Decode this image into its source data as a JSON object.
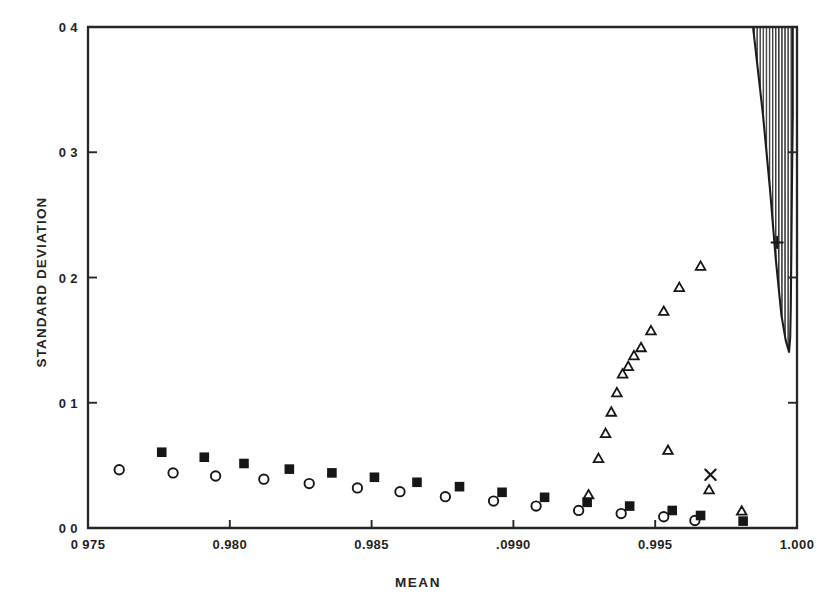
{
  "chart_data": {
    "type": "scatter",
    "title": "",
    "xlabel": "MEAN",
    "ylabel": "STANDARD DEVIATION",
    "xlim": [
      0.975,
      1.0
    ],
    "ylim": [
      0.0,
      0.4
    ],
    "grid": false,
    "legend": "none",
    "xticks": [
      0.975,
      0.98,
      0.985,
      0.99,
      0.995,
      1.0
    ],
    "xtick_labels": [
      "0 975",
      "0.980",
      "0.985",
      ".0990",
      "0.995",
      "1.000"
    ],
    "yticks": [
      0.0,
      0.1,
      0.2,
      0.3,
      0.4
    ],
    "ytick_labels": [
      "0 0",
      "0 1",
      "0 2",
      "0 3",
      "0 4"
    ],
    "series": [
      {
        "name": "filled-square-series",
        "marker": "filled-square",
        "points": [
          {
            "x": 0.9776,
            "y": 0.0605
          },
          {
            "x": 0.9791,
            "y": 0.0565
          },
          {
            "x": 0.9805,
            "y": 0.0515
          },
          {
            "x": 0.9821,
            "y": 0.047
          },
          {
            "x": 0.9836,
            "y": 0.044
          },
          {
            "x": 0.9851,
            "y": 0.0405
          },
          {
            "x": 0.9866,
            "y": 0.0365
          },
          {
            "x": 0.9881,
            "y": 0.033
          },
          {
            "x": 0.9896,
            "y": 0.0285
          },
          {
            "x": 0.9911,
            "y": 0.0245
          },
          {
            "x": 0.9926,
            "y": 0.0205
          },
          {
            "x": 0.9941,
            "y": 0.0175
          },
          {
            "x": 0.9956,
            "y": 0.014
          },
          {
            "x": 0.9966,
            "y": 0.01
          },
          {
            "x": 0.9981,
            "y": 0.0055
          }
        ]
      },
      {
        "name": "open-circle-series",
        "marker": "open-circle",
        "points": [
          {
            "x": 0.9761,
            "y": 0.0465
          },
          {
            "x": 0.978,
            "y": 0.044
          },
          {
            "x": 0.9795,
            "y": 0.0415
          },
          {
            "x": 0.9812,
            "y": 0.039
          },
          {
            "x": 0.9828,
            "y": 0.0355
          },
          {
            "x": 0.9845,
            "y": 0.032
          },
          {
            "x": 0.986,
            "y": 0.029
          },
          {
            "x": 0.9876,
            "y": 0.025
          },
          {
            "x": 0.9893,
            "y": 0.0215
          },
          {
            "x": 0.9908,
            "y": 0.0175
          },
          {
            "x": 0.9923,
            "y": 0.014
          },
          {
            "x": 0.9938,
            "y": 0.0115
          },
          {
            "x": 0.9953,
            "y": 0.009
          },
          {
            "x": 0.9964,
            "y": 0.006
          }
        ]
      },
      {
        "name": "open-triangle-series",
        "marker": "open-triangle",
        "points": [
          {
            "x": 0.99265,
            "y": 0.027
          },
          {
            "x": 0.993,
            "y": 0.056
          },
          {
            "x": 0.99325,
            "y": 0.076
          },
          {
            "x": 0.99345,
            "y": 0.093
          },
          {
            "x": 0.99365,
            "y": 0.1085
          },
          {
            "x": 0.99385,
            "y": 0.1235
          },
          {
            "x": 0.99405,
            "y": 0.1295
          },
          {
            "x": 0.99425,
            "y": 0.138
          },
          {
            "x": 0.9945,
            "y": 0.1445
          },
          {
            "x": 0.99485,
            "y": 0.158
          },
          {
            "x": 0.9953,
            "y": 0.1735
          },
          {
            "x": 0.99585,
            "y": 0.1925
          },
          {
            "x": 0.9966,
            "y": 0.2095
          },
          {
            "x": 0.99545,
            "y": 0.0625
          },
          {
            "x": 0.9969,
            "y": 0.031
          },
          {
            "x": 0.99805,
            "y": 0.014
          }
        ]
      },
      {
        "name": "cross-marker-series",
        "marker": "x-cross",
        "points": [
          {
            "x": 0.99695,
            "y": 0.0425
          }
        ]
      },
      {
        "name": "plus-marker-series",
        "marker": "plus",
        "points": [
          {
            "x": 0.9993,
            "y": 0.228
          }
        ]
      }
    ],
    "shaded_region": {
      "name": "hatched-funnel-region",
      "hatch": "vertical-lines",
      "description": "Narrow tapering hatched band at right edge extending from top of plot down to a rounded tip",
      "left_boundary": [
        {
          "x": 0.99845,
          "y": 0.4
        },
        {
          "x": 0.9988,
          "y": 0.33
        },
        {
          "x": 0.99905,
          "y": 0.27
        },
        {
          "x": 0.99925,
          "y": 0.215
        },
        {
          "x": 0.99945,
          "y": 0.17
        },
        {
          "x": 0.9996,
          "y": 0.15
        },
        {
          "x": 0.99972,
          "y": 0.1405
        }
      ],
      "right_boundary": [
        {
          "x": 0.99985,
          "y": 0.4
        },
        {
          "x": 0.99985,
          "y": 0.33
        },
        {
          "x": 0.99982,
          "y": 0.27
        },
        {
          "x": 0.9998,
          "y": 0.22
        },
        {
          "x": 0.99978,
          "y": 0.175
        },
        {
          "x": 0.99976,
          "y": 0.152
        },
        {
          "x": 0.99972,
          "y": 0.1405
        }
      ]
    }
  },
  "colors": {
    "axis": "#262626",
    "marker": "#161616",
    "text": "#1f1f1f",
    "background": "#ffffff"
  }
}
